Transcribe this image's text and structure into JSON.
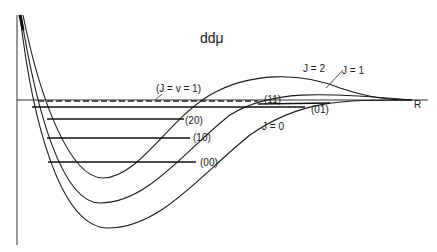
{
  "title": "ddμ",
  "axis": {
    "x_label": "R"
  },
  "curves": [
    {
      "id": "J0",
      "label": "J = 0"
    },
    {
      "id": "J1",
      "label": "J = 1"
    },
    {
      "id": "J2",
      "label": "J = 2"
    }
  ],
  "levels": [
    {
      "id": "00",
      "label": "(00)"
    },
    {
      "id": "10",
      "label": "(10)"
    },
    {
      "id": "20",
      "label": "(20)"
    },
    {
      "id": "01",
      "label": "(01)"
    },
    {
      "id": "11",
      "label": "(11)"
    }
  ],
  "resonance": {
    "label": "(J = v = 1)"
  },
  "colors": {
    "ink": "#1a1a1a",
    "background": "#ffffff"
  }
}
